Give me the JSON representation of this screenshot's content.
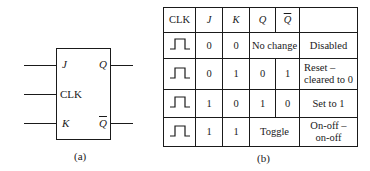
{
  "diagram_a": {
    "caption": "(a)",
    "block": "JK flip-flop",
    "inputs": [
      {
        "label": "J",
        "style": "italic"
      },
      {
        "label": "CLK",
        "style": "normal"
      },
      {
        "label": "K",
        "style": "italic"
      }
    ],
    "outputs": [
      {
        "label": "Q",
        "overline": false
      },
      {
        "label": "Q",
        "overline": true
      }
    ]
  },
  "table_b": {
    "caption": "(b)",
    "headers": [
      "CLK",
      "J",
      "K",
      "Q",
      "Q",
      ""
    ],
    "header_overline": [
      false,
      false,
      false,
      false,
      true,
      false
    ],
    "rows": [
      {
        "clk": "pulse-icon",
        "j": "0",
        "k": "0",
        "q_merged": "No change",
        "description": "Disabled"
      },
      {
        "clk": "pulse-icon",
        "j": "0",
        "k": "1",
        "q": "0",
        "qbar": "1",
        "description_line1": "Reset –",
        "description_line2": "cleared to 0"
      },
      {
        "clk": "pulse-icon",
        "j": "1",
        "k": "0",
        "q": "1",
        "qbar": "0",
        "description": "Set to 1"
      },
      {
        "clk": "pulse-icon",
        "j": "1",
        "k": "1",
        "q_merged": "Toggle",
        "description_line1": "On-off –",
        "description_line2": "on-off"
      }
    ]
  }
}
